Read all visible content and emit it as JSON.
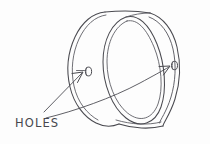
{
  "drawing": {
    "medium": "pencil-sketch",
    "subject": "cylindrical ring viewed in three-quarter perspective",
    "background_color": "#fdfdfd",
    "ink_color": "#4a4a50",
    "annotations": {
      "holes_label": "HOLES"
    },
    "features": [
      {
        "name": "near-face-rim",
        "kind": "outline",
        "description": "outer silhouette of the near circular face"
      },
      {
        "name": "far-face-rim",
        "kind": "outline",
        "description": "outer silhouette of the far circular face"
      },
      {
        "name": "bore-opening",
        "kind": "ellipse",
        "description": "inner bore opening ellipse with wall thickness"
      },
      {
        "name": "hole-left",
        "kind": "hole",
        "description": "small through hole on the near side wall"
      },
      {
        "name": "hole-right",
        "kind": "hole",
        "description": "small through hole on the far side wall"
      },
      {
        "name": "leader-left",
        "kind": "leader-arrow",
        "description": "straight arrow from label up-right to the left hole"
      },
      {
        "name": "leader-right",
        "kind": "leader-arrow",
        "description": "long curved arrow from label sweeping right to the right hole"
      }
    ]
  }
}
